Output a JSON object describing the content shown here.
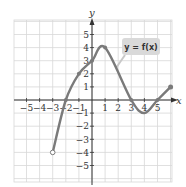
{
  "chart_data": {
    "type": "line",
    "title": "",
    "xlabel": "x",
    "ylabel": "y",
    "xlim": [
      -5,
      6
    ],
    "ylim": [
      -5,
      5
    ],
    "grid": true,
    "x_ticks": [
      "-5",
      "-4",
      "-3",
      "-2",
      "-1",
      "1",
      "2",
      "3",
      "4",
      "5"
    ],
    "y_ticks": [
      "5",
      "4",
      "3",
      "2",
      "1",
      "-1",
      "-2",
      "-3",
      "-4",
      "-5"
    ],
    "series": [
      {
        "name": "y = f(x)",
        "points": [
          [
            -3,
            -4
          ],
          [
            -2,
            0
          ],
          [
            -1,
            2
          ],
          [
            0,
            3
          ],
          [
            1,
            4
          ],
          [
            3,
            0
          ],
          [
            4,
            -1
          ],
          [
            5,
            0
          ],
          [
            6,
            1
          ]
        ],
        "start_endpoint": {
          "x": -3,
          "y": -4,
          "style": "open"
        },
        "end_endpoint": {
          "x": 6,
          "y": 1,
          "style": "closed"
        },
        "marked_points": [
          [
            -2,
            0
          ],
          [
            -1,
            2
          ],
          [
            0,
            3
          ],
          [
            1,
            4
          ],
          [
            3,
            0
          ],
          [
            5,
            0
          ]
        ]
      }
    ],
    "annotation": {
      "text": "y = f(x)"
    }
  },
  "colors": {
    "curve": "#7a7a7a",
    "grid": "#d8d8d8",
    "axis": "#333333",
    "label_box": "#d9d9d9"
  }
}
